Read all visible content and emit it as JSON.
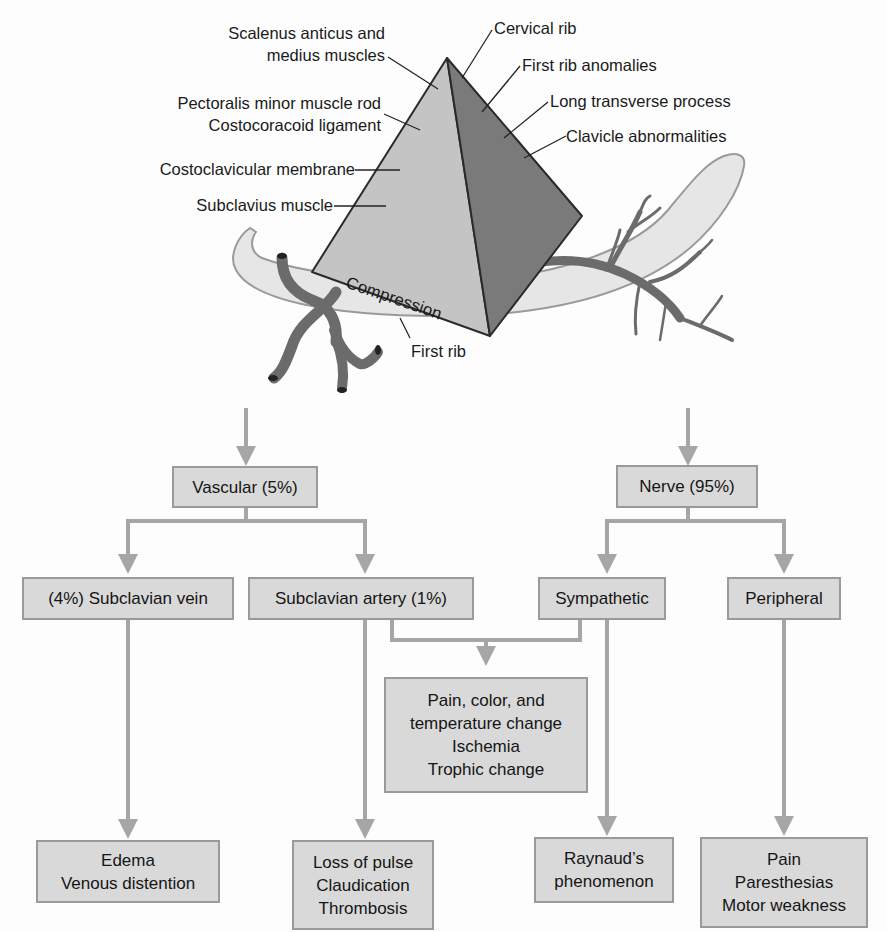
{
  "anatomy": {
    "left_labels": [
      {
        "id": "scalenus",
        "lines": [
          "Scalenus anticus and",
          "medius muscles"
        ]
      },
      {
        "id": "pectoralis",
        "lines": [
          "Pectoralis minor muscle rod",
          "Costocoracoid ligament"
        ]
      },
      {
        "id": "costoclavicular",
        "lines": [
          "Costoclavicular membrane"
        ]
      },
      {
        "id": "subclavius",
        "lines": [
          "Subclavius muscle"
        ]
      }
    ],
    "right_labels": [
      {
        "id": "cervical-rib",
        "text": "Cervical rib"
      },
      {
        "id": "first-rib-anomalies",
        "text": "First rib anomalies"
      },
      {
        "id": "long-transverse",
        "text": "Long transverse process"
      },
      {
        "id": "clavicle",
        "text": "Clavicle abnormalities"
      }
    ],
    "compression_label": "Compression",
    "first_rib_label": "First rib",
    "colors": {
      "pyramid_light": "#c4c4c4",
      "pyramid_dark": "#7a7a7a",
      "rib_fill": "#e6e6e6",
      "vessel": "#6b6b6b",
      "connector": "#a6a6a6",
      "box_fill": "#d9d9d9",
      "box_border": "#9a9a9a"
    }
  },
  "flowchart": {
    "level1": [
      {
        "id": "vascular",
        "label": "Vascular (5%)"
      },
      {
        "id": "nerve",
        "label": "Nerve (95%)"
      }
    ],
    "level2": [
      {
        "id": "subclavian-vein",
        "label": "(4%) Subclavian vein"
      },
      {
        "id": "subclavian-artery",
        "label": "Subclavian artery (1%)"
      },
      {
        "id": "sympathetic",
        "label": "Sympathetic"
      },
      {
        "id": "peripheral",
        "label": "Peripheral"
      }
    ],
    "shared_outcome": {
      "id": "pain-color-temp",
      "lines": [
        "Pain, color, and",
        "temperature change",
        "Ischemia",
        "Trophic change"
      ]
    },
    "outcomes": [
      {
        "id": "vein-outcome",
        "lines": [
          "Edema",
          "Venous distention"
        ]
      },
      {
        "id": "artery-outcome",
        "lines": [
          "Loss of pulse",
          "Claudication",
          "Thrombosis"
        ]
      },
      {
        "id": "sympathetic-outcome",
        "lines": [
          "Raynaud’s",
          "phenomenon"
        ]
      },
      {
        "id": "peripheral-outcome",
        "lines": [
          "Pain",
          "Paresthesias",
          "Motor weakness"
        ]
      }
    ]
  }
}
